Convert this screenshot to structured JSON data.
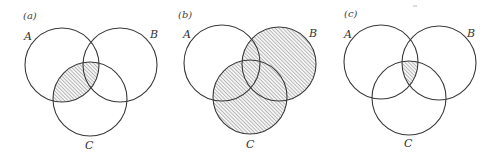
{
  "figure": {
    "stroke_color": "#3a3a3a",
    "hatch_color": "#7a7a7a",
    "panels": [
      {
        "id": "a",
        "label": "(a)",
        "shaded_region": "A ∩ C",
        "labels": {
          "A": "A",
          "B": "B",
          "C": "C"
        },
        "circles": {
          "A": {
            "cx": 62,
            "cy": 65,
            "r": 37
          },
          "B": {
            "cx": 120,
            "cy": 65,
            "r": 37
          },
          "C": {
            "cx": 90,
            "cy": 99,
            "r": 37
          }
        }
      },
      {
        "id": "b",
        "label": "(b)",
        "shaded_region": "B ∪ C",
        "labels": {
          "A": "A",
          "B": "B",
          "C": "C"
        },
        "circles": {
          "A": {
            "cx": 222,
            "cy": 63,
            "r": 38
          },
          "B": {
            "cx": 279,
            "cy": 64,
            "r": 37
          },
          "C": {
            "cx": 250,
            "cy": 97,
            "r": 37
          }
        }
      },
      {
        "id": "c",
        "label": "(c)",
        "shaded_region": "A ∩ B ∩ C",
        "labels": {
          "A": "A",
          "B": "B",
          "C": "C"
        },
        "circles": {
          "A": {
            "cx": 381,
            "cy": 62,
            "r": 37
          },
          "B": {
            "cx": 439,
            "cy": 63,
            "r": 37
          },
          "C": {
            "cx": 409,
            "cy": 98,
            "r": 37
          }
        }
      }
    ]
  }
}
